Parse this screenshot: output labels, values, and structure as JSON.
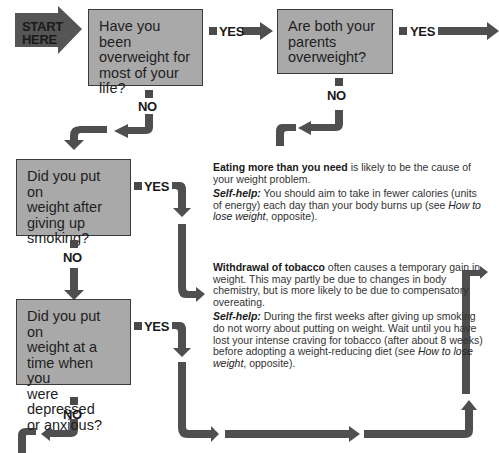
{
  "start": {
    "line1": "START",
    "line2": "HERE"
  },
  "questions": [
    {
      "id": "q1",
      "lines": [
        "Have you been",
        "overweight for",
        "most of your",
        "life?"
      ]
    },
    {
      "id": "q2",
      "lines": [
        "Are both your",
        "parents",
        "overweight?"
      ]
    },
    {
      "id": "q3",
      "lines": [
        "Did you put on",
        "weight after",
        "giving up",
        "smoking?"
      ]
    },
    {
      "id": "q4",
      "lines": [
        "Did you put on",
        "weight at a",
        "time when you",
        "were depressed",
        "or anxious?"
      ]
    }
  ],
  "answers": {
    "yes": "YES",
    "no": "NO"
  },
  "explanations": {
    "eating": {
      "bold_lead": "Eating more than you need",
      "text1": " is likely to be the cause of your weight problem.",
      "selfhelp_label": "Self-help:",
      "selfhelp_text1": " You should aim to take in fewer calories (units of energy) each day than your body burns up (see ",
      "selfhelp_ref": "How to lose weight",
      "selfhelp_text2": ", opposite)."
    },
    "tobacco": {
      "bold_lead": "Withdrawal of tobacco",
      "text1": " often causes a temporary gain in weight. This may partly be due to changes in body chemistry, but is more likely to be due to compensatory overeating.",
      "selfhelp_label": "Self-help:",
      "selfhelp_text1": " During the first weeks after giving up smoking do not worry about putting on weight. Wait until you have lost your intense craving for tobacco (after about 8 weeks) before adopting a weight-reducing diet (see ",
      "selfhelp_ref": "How to lose weight",
      "selfhelp_text2": ", opposite)."
    }
  },
  "colors": {
    "box_fill": "#a9a9a9",
    "box_border": "#3a3a3a",
    "arrow": "#4a4a4a",
    "start_arrow": "#555555"
  }
}
